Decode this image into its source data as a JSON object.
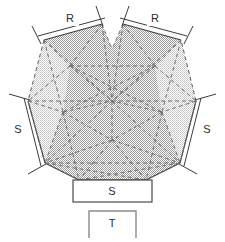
{
  "figure": {
    "background_color": "#ffffff",
    "outline_color": "#3a3a3a",
    "dashed_color": "#6f6f6f",
    "shade_color": "#c9c9c9",
    "shade_color_light": "#dcdcdc",
    "label_color": "#2b2b2b"
  },
  "labels": {
    "radius_left": "R",
    "radius_right": "R",
    "side_left": "S",
    "side_right": "S",
    "box_side": "S",
    "box_thickness": "T"
  },
  "boxes": {
    "side_box": {
      "label": "S",
      "x": 73,
      "y": 180,
      "width": 79,
      "height": 22
    },
    "thickness_box": {
      "label": "T",
      "x": 89,
      "y": 211,
      "width": 47,
      "height": 27
    }
  },
  "geometry": {
    "outer_vertices": [
      {
        "name": "top-left-notch",
        "x": 102,
        "y": 24
      },
      {
        "name": "top-right-notch",
        "x": 123,
        "y": 24
      },
      {
        "name": "upper-right",
        "x": 181,
        "y": 40
      },
      {
        "name": "right",
        "x": 196,
        "y": 101
      },
      {
        "name": "lower-right",
        "x": 180,
        "y": 163
      },
      {
        "name": "bottom-right",
        "x": 146,
        "y": 180
      },
      {
        "name": "bottom-left",
        "x": 79,
        "y": 180
      },
      {
        "name": "lower-left",
        "x": 45,
        "y": 163
      },
      {
        "name": "left",
        "x": 28,
        "y": 101
      },
      {
        "name": "upper-left",
        "x": 44,
        "y": 40
      }
    ],
    "tick_marks": [
      {
        "name": "tick-top-left-outer",
        "x1": 41,
        "y1": 44,
        "x2": 32,
        "y2": 26
      },
      {
        "name": "tick-top-left-inner",
        "x1": 103,
        "y1": 23,
        "x2": 96,
        "y2": 5
      },
      {
        "name": "tick-top-right-inner",
        "x1": 122,
        "y1": 23,
        "x2": 129,
        "y2": 5
      },
      {
        "name": "tick-top-right-outer",
        "x1": 184,
        "y1": 44,
        "x2": 193,
        "y2": 26
      },
      {
        "name": "tick-left-upper",
        "x1": 28,
        "y1": 101,
        "x2": 8,
        "y2": 95
      },
      {
        "name": "tick-left-lower",
        "x1": 45,
        "y1": 164,
        "x2": 27,
        "y2": 174
      },
      {
        "name": "tick-right-upper",
        "x1": 197,
        "y1": 101,
        "x2": 217,
        "y2": 95
      },
      {
        "name": "tick-right-lower",
        "x1": 180,
        "y1": 164,
        "x2": 198,
        "y2": 174
      }
    ],
    "dimension_lines": [
      {
        "name": "dim-R-left",
        "x1": 41,
        "y1": 37,
        "x2": 104,
        "y2": 20
      },
      {
        "name": "dim-R-right",
        "x1": 121,
        "y1": 20,
        "x2": 184,
        "y2": 37
      },
      {
        "name": "dim-S-left",
        "x1": 25,
        "y1": 99,
        "x2": 42,
        "y2": 166
      },
      {
        "name": "dim-S-right",
        "x1": 200,
        "y1": 99,
        "x2": 183,
        "y2": 166
      }
    ],
    "label_positions": {
      "radius_left": {
        "x": 70,
        "y": 18
      },
      "radius_right": {
        "x": 155,
        "y": 18
      },
      "side_left": {
        "x": 18,
        "y": 130
      },
      "side_right": {
        "x": 207,
        "y": 130
      },
      "box_side": {
        "x": 112,
        "y": 191
      },
      "box_thickness": {
        "x": 112,
        "y": 224
      }
    }
  }
}
